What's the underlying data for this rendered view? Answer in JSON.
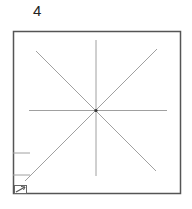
{
  "panel": {
    "number_label": "4",
    "colors": {
      "border": "#555555",
      "lines": "#a0a0a0",
      "center_dot": "#333333"
    }
  },
  "icons": {
    "corner_icon": "resize-arrow-icon"
  }
}
